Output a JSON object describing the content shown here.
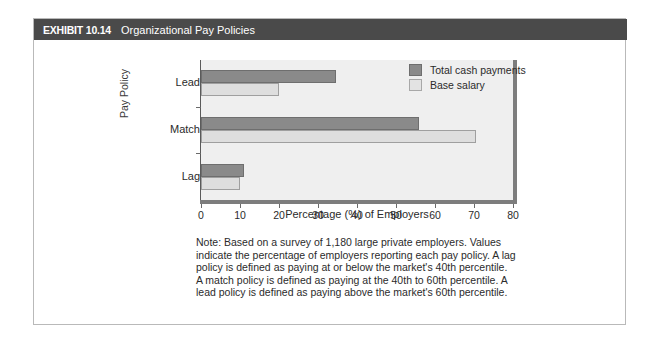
{
  "exhibit": {
    "label": "EXHIBIT 10.14",
    "title": "Organizational Pay Policies"
  },
  "legend": {
    "items": [
      {
        "label": "Total cash payments",
        "color": "#8a8a8a",
        "swatch": "dark"
      },
      {
        "label": "Base salary",
        "color": "#e3e3e3",
        "swatch": "light"
      }
    ]
  },
  "axes": {
    "ylabel": "Pay Policy",
    "xlabel": "Percentage (%) of Employers",
    "xticks": [
      "0",
      "10",
      "20",
      "30",
      "40",
      "50",
      "60",
      "70",
      "80"
    ],
    "categories": [
      "Lead",
      "Match",
      "Lag"
    ]
  },
  "note": {
    "lines": [
      "Note: Based on a survey of 1,180 large private employers. Values",
      "indicate the percentage of employers reporting each pay policy. A lag",
      "policy is defined as paying at or below the market's 40th percentile.",
      "A match policy is defined as paying at the 40th to 60th percentile. A",
      "lead policy is defined as paying above the market's 60th percentile."
    ]
  },
  "chart_data": {
    "type": "bar",
    "orientation": "horizontal",
    "title": "Organizational Pay Policies",
    "categories": [
      "Lead",
      "Match",
      "Lag"
    ],
    "series": [
      {
        "name": "Total cash payments",
        "color": "#8a8a8a",
        "values": [
          34.5,
          56,
          11
        ]
      },
      {
        "name": "Base salary",
        "color": "#e3e3e3",
        "values": [
          20,
          70.5,
          10
        ]
      }
    ],
    "xlabel": "Percentage (%) of Employers",
    "ylabel": "Pay Policy",
    "xlim": [
      0,
      80
    ],
    "xticks": [
      0,
      10,
      20,
      30,
      40,
      50,
      60,
      70,
      80
    ],
    "grid": false,
    "legend_position": "top-right",
    "plot_background": "#efefef"
  }
}
